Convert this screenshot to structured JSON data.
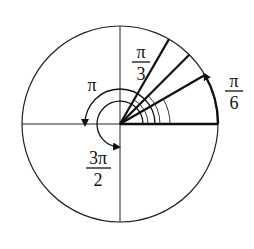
{
  "diagram": {
    "type": "unit-circle-angles",
    "center": [
      120,
      124
    ],
    "radius": 98,
    "stroke_color": "#111111",
    "rays_degrees": [
      0,
      30,
      45,
      60
    ],
    "labels": {
      "pi_over_3": {
        "num": "π",
        "den": "3"
      },
      "pi_over_6": {
        "num": "π",
        "den": "6"
      },
      "pi": {
        "text": "π"
      },
      "three_pi_over_2": {
        "num": "3π",
        "den": "2"
      }
    }
  }
}
